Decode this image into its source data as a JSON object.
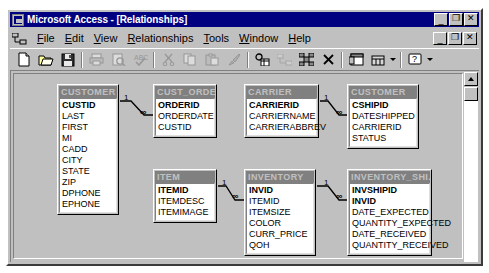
{
  "window": {
    "title": "Microsoft Access - [Relationships]",
    "app_icon": "access-icon",
    "minimize_label": "_",
    "maximize_label": "❐",
    "close_label": "✕",
    "child_minimize_label": "_",
    "child_restore_label": "❐",
    "child_close_label": "✕"
  },
  "menubar": {
    "doc_icon": "relationships-icon",
    "items": [
      {
        "label": "File",
        "accel": "F"
      },
      {
        "label": "Edit",
        "accel": "E"
      },
      {
        "label": "View",
        "accel": "V"
      },
      {
        "label": "Relationships",
        "accel": "R"
      },
      {
        "label": "Tools",
        "accel": "T"
      },
      {
        "label": "Window",
        "accel": "W"
      },
      {
        "label": "Help",
        "accel": "H"
      }
    ]
  },
  "toolbar": {
    "buttons": [
      {
        "name": "new-database-button",
        "icon": "new-page-icon",
        "enabled": true
      },
      {
        "name": "open-database-button",
        "icon": "open-folder-icon",
        "enabled": true
      },
      {
        "name": "save-button",
        "icon": "floppy-disk-icon",
        "enabled": true
      },
      {
        "name": "print-button",
        "icon": "printer-icon",
        "enabled": false
      },
      {
        "name": "print-preview-button",
        "icon": "print-preview-icon",
        "enabled": false
      },
      {
        "name": "spelling-button",
        "icon": "spell-check-icon",
        "enabled": false
      },
      {
        "name": "cut-button",
        "icon": "scissors-icon",
        "enabled": false
      },
      {
        "name": "copy-button",
        "icon": "copy-icon",
        "enabled": false
      },
      {
        "name": "paste-button",
        "icon": "clipboard-paste-icon",
        "enabled": false
      },
      {
        "name": "format-painter-button",
        "icon": "paintbrush-icon",
        "enabled": false
      },
      {
        "name": "show-table-button",
        "icon": "show-table-icon",
        "enabled": true
      },
      {
        "name": "show-direct-relationships-button",
        "icon": "direct-relationships-icon",
        "enabled": false
      },
      {
        "name": "show-all-relationships-button",
        "icon": "all-relationships-icon",
        "enabled": true
      },
      {
        "name": "clear-layout-button",
        "icon": "close-x-icon",
        "enabled": true
      },
      {
        "name": "database-window-button",
        "icon": "database-window-icon",
        "enabled": true
      },
      {
        "name": "new-object-button",
        "icon": "new-object-icon",
        "enabled": true
      },
      {
        "name": "help-button",
        "icon": "help-question-icon",
        "enabled": true
      }
    ]
  },
  "canvas": {
    "tables": [
      {
        "id": "customer-left",
        "name": "CUSTOMER",
        "x": 43,
        "y": 10,
        "width": 62,
        "fields": [
          {
            "label": "CUSTID",
            "pk": true
          },
          {
            "label": "LAST",
            "pk": false
          },
          {
            "label": "FIRST",
            "pk": false
          },
          {
            "label": "MI",
            "pk": false
          },
          {
            "label": "CADD",
            "pk": false
          },
          {
            "label": "CITY",
            "pk": false
          },
          {
            "label": "STATE",
            "pk": false
          },
          {
            "label": "ZIP",
            "pk": false
          },
          {
            "label": "DPHONE",
            "pk": false
          },
          {
            "label": "EPHONE",
            "pk": false
          }
        ]
      },
      {
        "id": "cust-order",
        "name": "CUST_ORDER",
        "x": 139,
        "y": 10,
        "width": 64,
        "fields": [
          {
            "label": "ORDERID",
            "pk": true
          },
          {
            "label": "ORDERDATE",
            "pk": false
          },
          {
            "label": "CUSTID",
            "pk": false
          }
        ]
      },
      {
        "id": "carrier",
        "name": "CARRIER",
        "x": 230,
        "y": 10,
        "width": 75,
        "fields": [
          {
            "label": "CARRIERID",
            "pk": true
          },
          {
            "label": "CARRIERNAME",
            "pk": false
          },
          {
            "label": "CARRIERABBREV",
            "pk": false
          }
        ]
      },
      {
        "id": "customer-right",
        "name": "CUSTOMER",
        "x": 333,
        "y": 10,
        "width": 72,
        "fields": [
          {
            "label": "CSHIPID",
            "pk": true
          },
          {
            "label": "DATESHIPPED",
            "pk": false
          },
          {
            "label": "CARRIERID",
            "pk": false
          },
          {
            "label": "STATUS",
            "pk": false
          }
        ]
      },
      {
        "id": "item",
        "name": "ITEM",
        "x": 139,
        "y": 95,
        "width": 64,
        "fields": [
          {
            "label": "ITEMID",
            "pk": true
          },
          {
            "label": "ITEMDESC",
            "pk": false
          },
          {
            "label": "ITEMIMAGE",
            "pk": false
          }
        ]
      },
      {
        "id": "inventory",
        "name": "INVENTORY",
        "x": 230,
        "y": 95,
        "width": 72,
        "fields": [
          {
            "label": "INVID",
            "pk": true
          },
          {
            "label": "ITEMID",
            "pk": false
          },
          {
            "label": "ITEMSIZE",
            "pk": false
          },
          {
            "label": "COLOR",
            "pk": false
          },
          {
            "label": "CURR_PRICE",
            "pk": false
          },
          {
            "label": "QOH",
            "pk": false
          }
        ]
      },
      {
        "id": "inventory-ship",
        "name": "INVENTORY_SHI...",
        "x": 333,
        "y": 95,
        "width": 85,
        "fields": [
          {
            "label": "INVSHIPID",
            "pk": true
          },
          {
            "label": "INVID",
            "pk": true
          },
          {
            "label": "DATE_EXPECTED",
            "pk": false
          },
          {
            "label": "QUANTITY_EXPECTED",
            "pk": false
          },
          {
            "label": "DATE_RECEIVED",
            "pk": false
          },
          {
            "label": "QUANTITY_RECEIVED",
            "pk": false
          }
        ]
      }
    ],
    "relationships": [
      {
        "id": "customer-to-custorder",
        "from_table": "CUSTOMER",
        "to_table": "CUST_ORDER",
        "one_label": "1",
        "many_label": "∞",
        "one_x": 110,
        "one_y": 20,
        "many_x": 126,
        "many_y": 34,
        "path": "M 106 27 L 117 27 L 130 41 L 139 41"
      },
      {
        "id": "carrier-to-customer",
        "from_table": "CARRIER",
        "to_table": "CUSTOMER",
        "one_label": "1",
        "many_label": "∞",
        "one_x": 310,
        "one_y": 20,
        "many_x": 322,
        "many_y": 34,
        "path": "M 306 27 L 314 27 L 325 41 L 333 41"
      },
      {
        "id": "item-to-inventory",
        "from_table": "ITEM",
        "to_table": "INVENTORY",
        "one_label": "1",
        "many_label": "∞",
        "one_x": 208,
        "one_y": 105,
        "many_x": 218,
        "many_y": 118,
        "path": "M 204 112 L 212 112 L 221 126 L 230 126"
      },
      {
        "id": "inventory-to-inventoryship",
        "from_table": "INVENTORY",
        "to_table": "INVENTORY_SHI...",
        "one_label": "1",
        "many_label": "∞",
        "one_x": 310,
        "one_y": 105,
        "many_x": 322,
        "many_y": 118,
        "path": "M 303 112 L 314 112 L 325 126 L 333 126"
      }
    ]
  },
  "scrollbar": {
    "name": "vertical-scrollbar",
    "up_arrow": "scroll-up-icon",
    "thumb": "scroll-thumb"
  }
}
